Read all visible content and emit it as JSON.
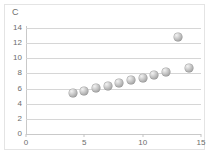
{
  "chart_data": {
    "type": "scatter",
    "title": "",
    "subtitle": "",
    "corner_label": "C",
    "xlabel": "",
    "ylabel": "",
    "xlim": [
      0,
      15
    ],
    "ylim": [
      0,
      14
    ],
    "xticks": [
      0,
      5,
      10,
      15
    ],
    "yticks": [
      0,
      2,
      4,
      6,
      8,
      10,
      12,
      14
    ],
    "xtick_labels": [
      "0",
      "5",
      "10",
      "15"
    ],
    "ytick_labels": [
      "0",
      "2",
      "4",
      "6",
      "8",
      "10",
      "12",
      "14"
    ],
    "grid": "horizontal",
    "legend": null,
    "legend_position": "none",
    "marker_style": "gray-sphere",
    "marker_color": "#b0b0b0",
    "gridline_color": "#d6d6d6",
    "axis_color": "#c9c9c9",
    "text_color": "#6d6d6d",
    "background_color": "#ffffff",
    "series": [
      {
        "name": "C",
        "points": [
          {
            "x": 4,
            "y": 5.4
          },
          {
            "x": 5,
            "y": 5.7
          },
          {
            "x": 6,
            "y": 6.1
          },
          {
            "x": 7,
            "y": 6.4
          },
          {
            "x": 8,
            "y": 6.7
          },
          {
            "x": 9,
            "y": 7.1
          },
          {
            "x": 10,
            "y": 7.4
          },
          {
            "x": 11,
            "y": 7.8
          },
          {
            "x": 12,
            "y": 8.2
          },
          {
            "x": 13,
            "y": 12.8
          },
          {
            "x": 14,
            "y": 8.7
          }
        ]
      }
    ],
    "annotations": []
  }
}
